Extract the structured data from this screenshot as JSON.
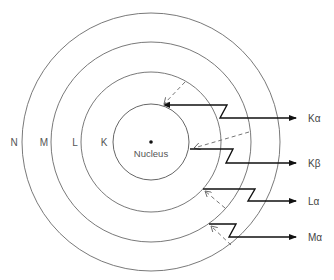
{
  "diagram": {
    "type": "atomic-shell-xray-emission",
    "nucleus": {
      "label": "Nucleus"
    },
    "shells": [
      {
        "id": "K",
        "label": "K"
      },
      {
        "id": "L",
        "label": "L"
      },
      {
        "id": "M",
        "label": "M"
      },
      {
        "id": "N",
        "label": "N"
      }
    ],
    "transitions": [
      {
        "id": "Ka",
        "from": "L",
        "to": "K",
        "label": "Kα"
      },
      {
        "id": "Kb",
        "from": "M",
        "to": "K",
        "label": "Kβ"
      },
      {
        "id": "La",
        "from": "M",
        "to": "L",
        "label": "Lα"
      },
      {
        "id": "Ma",
        "from": "N",
        "to": "M",
        "label": "Mα"
      }
    ]
  }
}
